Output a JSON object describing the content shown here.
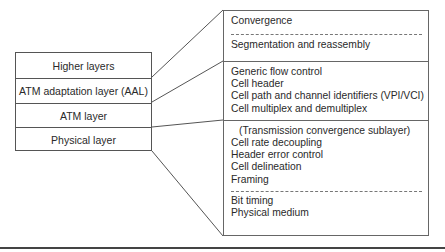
{
  "diagram": {
    "type": "layer-stack-expansion",
    "left_stack": {
      "layers": [
        {
          "id": "higher",
          "label": "Higher layers"
        },
        {
          "id": "aal",
          "label": "ATM adaptation layer (AAL)"
        },
        {
          "id": "atm",
          "label": "ATM layer"
        },
        {
          "id": "physical",
          "label": "Physical layer"
        }
      ]
    },
    "right_detail": {
      "aal_section": {
        "top_items": [
          "Convergence"
        ],
        "bottom_items": [
          "Segmentation and reassembly"
        ]
      },
      "atm_section": {
        "items": [
          "Generic flow control",
          "Cell header",
          "Cell path and channel identifiers (VPI/VCI)",
          "Cell multiplex and demultiplex"
        ]
      },
      "physical_section": {
        "sublayer_title": "(Transmission convergence sublayer)",
        "tc_items": [
          "Cell rate decoupling",
          "Header error control",
          "Cell delineation",
          "Framing"
        ],
        "pm_items": [
          "Bit timing",
          "Physical medium"
        ]
      }
    },
    "colors": {
      "line": "#555555",
      "text": "#2a2a2a",
      "background": "#ffffff"
    }
  }
}
